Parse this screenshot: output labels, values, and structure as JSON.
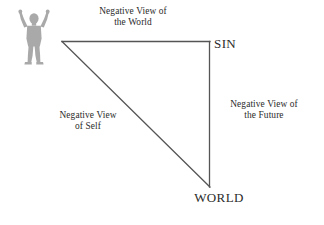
{
  "diagram": {
    "background_color": "#ffffff",
    "line_color": "#555555",
    "text_color": "#2b2b2b",
    "figure_color": "#a8a8a8",
    "figure": {
      "name": "person-raised-arms",
      "description": "Gray silhouette of a person with arms raised"
    },
    "vertices": [
      {
        "id": "top-left",
        "label": "",
        "x": 62,
        "y": 41
      },
      {
        "id": "top-right",
        "label": "SIN",
        "x": 210,
        "y": 41
      },
      {
        "id": "bottom-right",
        "label": "WORLD",
        "x": 210,
        "y": 187
      }
    ],
    "edges": [
      {
        "id": "top",
        "label": "Negative View of\nthe World",
        "from": "top-left",
        "to": "top-right"
      },
      {
        "id": "hypotenuse",
        "label": "Negative View\nof Self",
        "from": "top-left",
        "to": "bottom-right"
      },
      {
        "id": "right",
        "label": "Negative View of\nthe Future",
        "from": "top-right",
        "to": "bottom-right"
      }
    ],
    "labels": {
      "world_view": "Negative View of\nthe World",
      "self_view": "Negative View\nof Self",
      "future_view": "Negative View of\nthe Future",
      "sin": "SIN",
      "world": "WORLD"
    }
  }
}
